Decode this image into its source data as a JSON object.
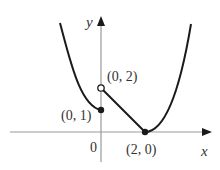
{
  "figure": {
    "type": "piecewise function graph",
    "axes": {
      "x_label": "x",
      "y_label": "y",
      "origin_label": "0"
    },
    "points": [
      {
        "label": "(0, 1)",
        "x": 0,
        "y": 1,
        "style": "closed"
      },
      {
        "label": "(0, 2)",
        "x": 0,
        "y": 2,
        "style": "open"
      },
      {
        "label": "(2, 0)",
        "x": 2,
        "y": 0,
        "style": "closed"
      }
    ],
    "pieces": [
      {
        "name": "left-parabola",
        "domain": "x <= 0",
        "description": "decreasing curve ending at closed point (0,1)"
      },
      {
        "name": "middle-line",
        "domain": "0 < x <= 2",
        "description": "line from open point (0,2) down to (2,0)"
      },
      {
        "name": "right-parabola",
        "domain": "x >= 2",
        "description": "increasing curve from (2,0)"
      }
    ],
    "colors": {
      "curve": "#1a1a1a",
      "axis": "#888888",
      "label": "#333333"
    }
  }
}
